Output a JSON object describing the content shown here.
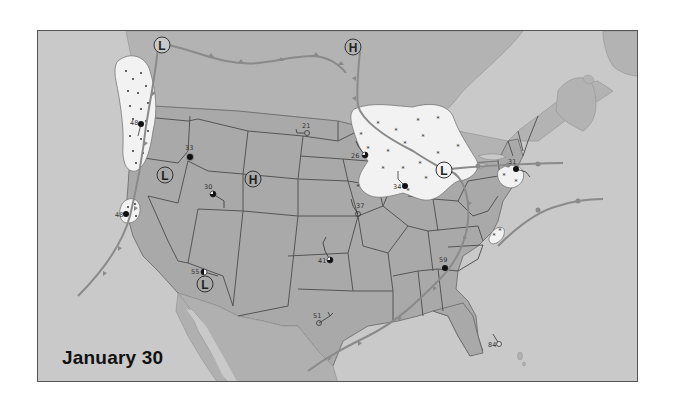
{
  "title": "January 30",
  "colors": {
    "ocean": "#c9c9c9",
    "land_us": "#a9a9a9",
    "land_canada": "#b3b3b3",
    "land_mexico": "#b0b0b0",
    "state_border": "#555555",
    "front": "#8a8a8a",
    "precip_area": "#f2f2f2",
    "station_fill": "#111111",
    "frame": "#555555"
  },
  "pressure_centers": [
    {
      "type": "L",
      "label": "L",
      "x": 124,
      "y": 14,
      "region": "British Columbia"
    },
    {
      "type": "H",
      "label": "H",
      "x": 315,
      "y": 16,
      "region": "Saskatchewan"
    },
    {
      "type": "L",
      "label": "L",
      "x": 127,
      "y": 144,
      "region": "Nevada"
    },
    {
      "type": "H",
      "label": "H",
      "x": 215,
      "y": 148,
      "region": "Colorado"
    },
    {
      "type": "L",
      "label": "L",
      "x": 167,
      "y": 253,
      "region": "Arizona"
    },
    {
      "type": "L",
      "label": "L",
      "x": 406,
      "y": 139,
      "region": "Michigan"
    }
  ],
  "stations": [
    {
      "id": "seattle",
      "temp": "48",
      "x": 103,
      "y": 93,
      "cover": "full"
    },
    {
      "id": "boise",
      "temp": "33",
      "x": 152,
      "y": 126,
      "cover": "full"
    },
    {
      "id": "san-francisco",
      "temp": "48",
      "x": 88,
      "y": 183,
      "cover": "full"
    },
    {
      "id": "salt-lake-city",
      "temp": "30",
      "x": 175,
      "y": 163,
      "cover": "three-quarter"
    },
    {
      "id": "bismarck",
      "temp": "21",
      "x": 269,
      "y": 102,
      "cover": "clear"
    },
    {
      "id": "minneapolis",
      "temp": "26",
      "x": 327,
      "y": 124,
      "cover": "three-quarter"
    },
    {
      "id": "chicago",
      "temp": "34",
      "x": 367,
      "y": 155,
      "cover": "full"
    },
    {
      "id": "kansas-city",
      "temp": "37",
      "x": 320,
      "y": 183,
      "cover": "clear"
    },
    {
      "id": "oklahoma-city",
      "temp": "41",
      "x": 292,
      "y": 229,
      "cover": "three-quarter"
    },
    {
      "id": "phoenix",
      "temp": "55",
      "x": 166,
      "y": 241,
      "cover": "half"
    },
    {
      "id": "dallas",
      "temp": "51",
      "x": 281,
      "y": 292,
      "cover": "clear"
    },
    {
      "id": "atlanta",
      "temp": "59",
      "x": 407,
      "y": 237,
      "cover": "full"
    },
    {
      "id": "new-york",
      "temp": "31",
      "x": 478,
      "y": 138,
      "cover": "full"
    },
    {
      "id": "miami",
      "temp": "84",
      "x": 461,
      "y": 313,
      "cover": "clear"
    }
  ],
  "precip_areas": [
    {
      "id": "pacific-northwest",
      "type": "rain"
    },
    {
      "id": "northern-california",
      "type": "rain"
    },
    {
      "id": "upper-midwest",
      "type": "snow"
    },
    {
      "id": "new-york",
      "type": "snow"
    },
    {
      "id": "virginia",
      "type": "snow"
    }
  ]
}
